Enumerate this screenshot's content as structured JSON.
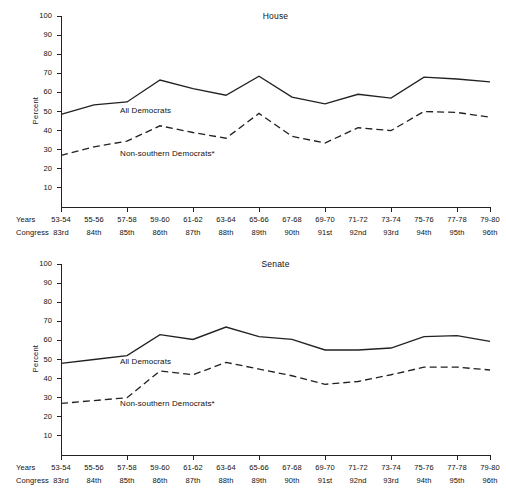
{
  "page": {
    "background": "#ffffff",
    "ink": "#222222"
  },
  "axis": {
    "y_title": "Percent",
    "y_ticks": [
      "100",
      "90",
      "80",
      "70",
      "60",
      "50",
      "40",
      "30",
      "20",
      "10"
    ],
    "row_label_years": "Years",
    "row_label_congress": "Congress"
  },
  "series_labels": {
    "all": "All Democrats",
    "nonsouth": "Non-southern Democrats*"
  },
  "chart_data": [
    {
      "type": "line",
      "title": "House",
      "xlabel": "",
      "ylabel": "Percent",
      "ylim": [
        0,
        100
      ],
      "ytick_step": 10,
      "grid": false,
      "legend": "inline-annotation",
      "categories": [
        "53-54",
        "55-56",
        "57-58",
        "59-60",
        "61-62",
        "63-64",
        "65-66",
        "67-68",
        "69-70",
        "71-72",
        "73-74",
        "75-76",
        "77-78",
        "79-80"
      ],
      "categories_secondary": [
        "83rd",
        "84th",
        "85th",
        "86th",
        "87th",
        "88th",
        "89th",
        "90th",
        "91st",
        "92nd",
        "93rd",
        "94th",
        "95th",
        "96th"
      ],
      "series": [
        {
          "name": "All Democrats",
          "style": "solid",
          "values": [
            48.5,
            53.5,
            55.0,
            66.5,
            62.0,
            58.5,
            68.5,
            57.5,
            54.0,
            59.0,
            57.0,
            68.0,
            67.0,
            65.5
          ]
        },
        {
          "name": "Non-southern Democrats*",
          "style": "dashed",
          "values": [
            27.0,
            31.5,
            34.5,
            42.5,
            39.0,
            36.0,
            49.0,
            37.0,
            33.5,
            41.5,
            40.0,
            50.0,
            49.5,
            47.0
          ]
        }
      ]
    },
    {
      "type": "line",
      "title": "Senate",
      "xlabel": "",
      "ylabel": "Percent",
      "ylim": [
        0,
        100
      ],
      "ytick_step": 10,
      "grid": false,
      "legend": "inline-annotation",
      "categories": [
        "53-54",
        "55-56",
        "57-58",
        "59-60",
        "61-62",
        "63-64",
        "65-66",
        "67-68",
        "69-70",
        "71-72",
        "73-74",
        "75-76",
        "77-78",
        "79-80"
      ],
      "categories_secondary": [
        "83rd",
        "84th",
        "85th",
        "86th",
        "87th",
        "88th",
        "89th",
        "90th",
        "91st",
        "92nd",
        "93rd",
        "94th",
        "95th",
        "96th"
      ],
      "series": [
        {
          "name": "All Democrats",
          "style": "solid",
          "values": [
            48.0,
            50.0,
            52.0,
            63.0,
            60.5,
            67.0,
            62.0,
            60.5,
            55.0,
            55.0,
            56.0,
            62.0,
            62.5,
            59.5
          ]
        },
        {
          "name": "Non-southern Democrats*",
          "style": "dashed",
          "values": [
            27.0,
            28.5,
            30.0,
            44.0,
            42.0,
            48.5,
            45.0,
            41.5,
            37.0,
            38.5,
            42.0,
            46.0,
            46.0,
            44.5
          ]
        }
      ]
    }
  ]
}
